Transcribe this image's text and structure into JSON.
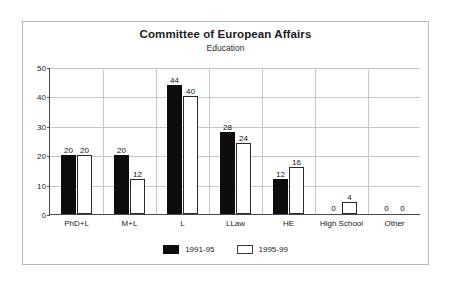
{
  "chart_data": {
    "type": "bar",
    "title": "Committee of European Affairs",
    "subtitle": "Education",
    "xlabel": "",
    "ylabel": "",
    "ylim": [
      0,
      50
    ],
    "yticks": [
      0,
      10,
      20,
      30,
      40,
      50
    ],
    "grid": true,
    "legend_position": "bottom",
    "categories": [
      "PhD+L",
      "M+L",
      "L",
      "LLaw",
      "HE",
      "High School",
      "Other"
    ],
    "series": [
      {
        "name": "1991-95",
        "color": "#0d0d0d",
        "values": [
          20,
          20,
          44,
          28,
          12,
          0,
          0
        ]
      },
      {
        "name": "1995-99",
        "color": "#ffffff",
        "values": [
          20,
          12,
          40,
          24,
          16,
          4,
          0
        ]
      }
    ]
  },
  "legend": {
    "entries": [
      {
        "label": "1991-95"
      },
      {
        "label": "1995-99"
      }
    ]
  }
}
